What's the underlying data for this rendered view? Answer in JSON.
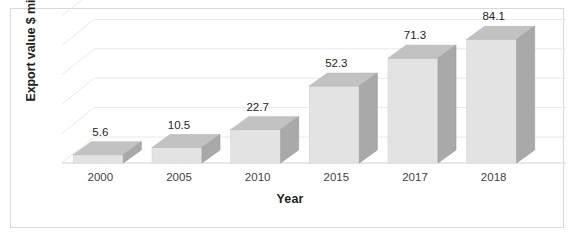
{
  "chart_data": {
    "type": "bar",
    "title": "",
    "subtitle": "",
    "xlabel": "Year",
    "ylabel": "Export value $ million",
    "categories": [
      "2000",
      "2005",
      "2010",
      "2015",
      "2017",
      "2018"
    ],
    "values": [
      5.6,
      10.5,
      22.7,
      52.3,
      71.3,
      84.1
    ],
    "value_labels": [
      "5.6",
      "10.5",
      "22.7",
      "52.3",
      "71.3",
      "84.1"
    ],
    "series": [
      {
        "name": "Export value",
        "values": [
          5.6,
          10.5,
          22.7,
          52.3,
          71.3,
          84.1
        ]
      }
    ],
    "ylim": [
      0,
      100
    ],
    "gridlines": [
      0,
      20,
      40,
      60,
      80,
      100
    ],
    "grid": true,
    "legend": "none",
    "style": "3d-bar",
    "colors": {
      "bar_front": "#e3e3e3",
      "bar_top": "#c2c2c2",
      "bar_side": "#a9a9a9",
      "gridline": "#e8e8e8",
      "axis_line": "#d2d2d2",
      "text": "#231f20",
      "tick_text": "#3f3f3f",
      "border": "#d9d9d9",
      "background": "#ffffff"
    }
  }
}
